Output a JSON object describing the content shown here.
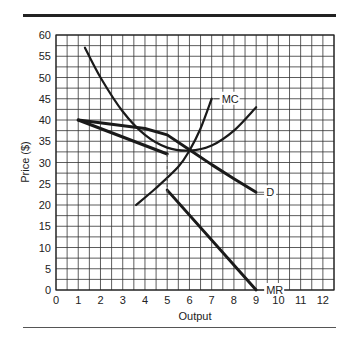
{
  "chart_data": {
    "type": "line",
    "title": "",
    "xlabel": "Output",
    "ylabel": "Price ($)",
    "xlim": [
      0,
      12.5
    ],
    "ylim": [
      0,
      60
    ],
    "x_ticks": [
      "0",
      "1",
      "2",
      "3",
      "4",
      "5",
      "6",
      "7",
      "8",
      "9",
      "10",
      "11",
      "12"
    ],
    "y_ticks": [
      "0",
      "5",
      "10",
      "15",
      "20",
      "25",
      "30",
      "35",
      "40",
      "45",
      "50",
      "55",
      "60"
    ],
    "grid": true,
    "grid_step": {
      "x": 0.5,
      "y": 2.5
    },
    "series": [
      {
        "name": "D",
        "label": "D",
        "points": [
          [
            1,
            40
          ],
          [
            4,
            38
          ],
          [
            5,
            36.5
          ],
          [
            6,
            33
          ],
          [
            7,
            29.5
          ],
          [
            8,
            26.2
          ],
          [
            9,
            23
          ]
        ]
      },
      {
        "name": "MR (upper)",
        "label": "",
        "points": [
          [
            1,
            40
          ],
          [
            5,
            32
          ]
        ]
      },
      {
        "name": "MR",
        "label": "MR",
        "points": [
          [
            5,
            23.5
          ],
          [
            9,
            0
          ]
        ]
      },
      {
        "name": "ATC",
        "label": "",
        "points": [
          [
            1.3,
            57
          ],
          [
            2,
            50
          ],
          [
            3,
            42
          ],
          [
            4,
            36.5
          ],
          [
            5,
            33.5
          ],
          [
            6,
            32.8
          ],
          [
            7,
            34
          ],
          [
            8,
            37.5
          ],
          [
            9,
            43
          ]
        ]
      },
      {
        "name": "MC",
        "label": "MC",
        "points": [
          [
            3.6,
            20
          ],
          [
            4.5,
            24
          ],
          [
            5.5,
            29
          ],
          [
            6,
            32.8
          ],
          [
            6.5,
            38
          ],
          [
            7,
            45
          ]
        ]
      }
    ],
    "annotations": [
      {
        "type": "dashed-vertical",
        "x": 5,
        "y_from": 32,
        "y_to": 22
      }
    ]
  }
}
